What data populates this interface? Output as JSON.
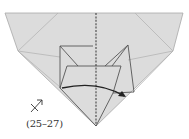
{
  "diagram": {
    "type": "origami-fold-step",
    "colors": {
      "paper": "#dcdcdc",
      "paper_edge": "#a8a8a8",
      "crease": "#b8b8b8",
      "flap_line": "#555555",
      "center_dashed": "#444444",
      "arrow": "#222222",
      "background": "#ffffff"
    },
    "annotations": {
      "step_range": "(25–27)",
      "view_symbol": "turn-over-zoom-arrow"
    }
  }
}
